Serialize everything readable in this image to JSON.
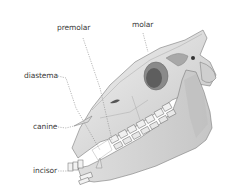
{
  "diagram": {
    "labels": [
      {
        "id": "premolar",
        "text": "premolar"
      },
      {
        "id": "molar",
        "text": "molar"
      },
      {
        "id": "diastema",
        "text": "diastema"
      },
      {
        "id": "canine",
        "text": "canine"
      },
      {
        "id": "incisor",
        "text": "incisor"
      }
    ],
    "colors": {
      "bone_light": "#e4e4e4",
      "bone_mid": "#bdbdbd",
      "bone_dark": "#6a6a6a",
      "outline": "#7a7a7a",
      "leader": "#8a8a8a",
      "text": "#3a3a3a"
    }
  }
}
